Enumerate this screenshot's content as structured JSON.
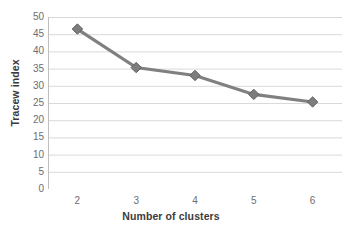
{
  "artifact": {
    "top_cut_text": "``"
  },
  "chart_data": {
    "type": "line",
    "title": "",
    "xlabel": "Number of clusters",
    "ylabel": "Tracew index",
    "x": [
      2,
      3,
      4,
      5,
      6
    ],
    "values": [
      46.5,
      35.3,
      33.0,
      27.5,
      25.3
    ],
    "series": [
      {
        "name": "Tracew index",
        "values": [
          46.5,
          35.3,
          33.0,
          27.5,
          25.3
        ]
      }
    ],
    "xlim": [
      1.5,
      6.5
    ],
    "ylim": [
      0,
      50
    ],
    "ytick_labels": [
      "50",
      "45",
      "40",
      "35",
      "30",
      "25",
      "20",
      "15",
      "10",
      "5",
      "0"
    ],
    "ytick_values": [
      50,
      45,
      40,
      35,
      30,
      25,
      20,
      15,
      10,
      5,
      0
    ],
    "xtick_labels": [
      "2",
      "3",
      "4",
      "5",
      "6"
    ],
    "grid": "horizontal",
    "legend": "none",
    "colors": {
      "line": "#808080",
      "marker": "#7d7d7d",
      "marker_edge": "#616161",
      "gridline": "#d9d9d9",
      "axis": "#bfbfbf",
      "tick_text": "#6d6e71",
      "axis_title": "#3b3b3b",
      "background": "#ffffff"
    },
    "marker_shape": "diamond",
    "line_width_px": 3.2
  }
}
